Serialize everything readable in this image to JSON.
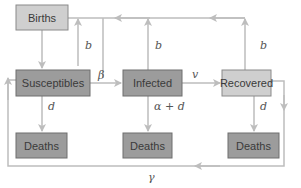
{
  "diagram": {
    "type": "SIR compartment model",
    "colors": {
      "box_light": "#cfcfcf",
      "box_dark": "#9c9c9c",
      "arrow": "#bdbdbd",
      "text": "#3a3a3a"
    },
    "nodes": {
      "births": "Births",
      "susceptibles": "Susceptibles",
      "infected": "Infected",
      "recovered": "Recovered",
      "deaths_s": "Deaths",
      "deaths_i": "Deaths",
      "deaths_r": "Deaths"
    },
    "edges": {
      "births_to_s": "",
      "s_to_births": "b",
      "i_to_births": "b",
      "r_to_births": "b",
      "s_to_i": "β",
      "i_to_r": "v",
      "s_to_deaths": "d",
      "i_to_deaths": "α + d",
      "r_to_deaths": "d",
      "r_to_s": "γ"
    }
  }
}
